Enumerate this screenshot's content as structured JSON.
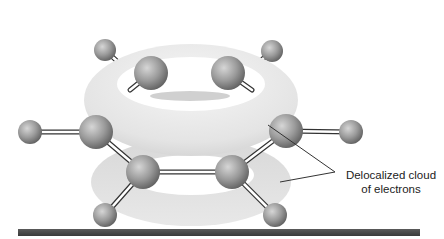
{
  "figure": {
    "label": {
      "line1": "Delocalized cloud",
      "line2": "of electrons"
    },
    "colors": {
      "background": "#ffffff",
      "atom": "#8c8c8c",
      "atom_highlight": "#d0d0d0",
      "cloud": "#e2e2e2",
      "bond": "#ffffff",
      "bond_outline": "#333333",
      "floor_bar": "#4a4a4a",
      "leader_line": "#333333"
    },
    "atoms": [
      {
        "id": "h-top-left",
        "element": "H",
        "x": 105,
        "y": 50
      },
      {
        "id": "h-top-right",
        "element": "H",
        "x": 272,
        "y": 51
      },
      {
        "id": "c-back-left",
        "element": "C",
        "x": 151,
        "y": 73
      },
      {
        "id": "c-back-right",
        "element": "C",
        "x": 228,
        "y": 73
      },
      {
        "id": "h-left",
        "element": "H",
        "x": 30,
        "y": 132
      },
      {
        "id": "c-left",
        "element": "C",
        "x": 96,
        "y": 132
      },
      {
        "id": "c-right",
        "element": "C",
        "x": 286,
        "y": 131
      },
      {
        "id": "h-right",
        "element": "H",
        "x": 351,
        "y": 132
      },
      {
        "id": "c-front-left",
        "element": "C",
        "x": 143,
        "y": 172
      },
      {
        "id": "c-front-right",
        "element": "C",
        "x": 232,
        "y": 172
      },
      {
        "id": "h-bottom-left",
        "element": "H",
        "x": 105,
        "y": 215
      },
      {
        "id": "h-bottom-right",
        "element": "H",
        "x": 275,
        "y": 215
      }
    ]
  }
}
